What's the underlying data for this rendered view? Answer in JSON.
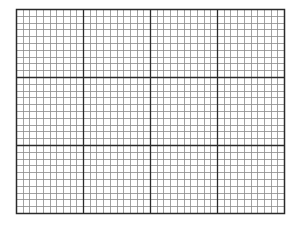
{
  "graph_paper": {
    "left": 16,
    "top": 9,
    "width": 268,
    "height": 204,
    "major_columns": 4,
    "major_rows": 3,
    "minor_per_major": 10,
    "colors": {
      "background": "#ffffff",
      "minor_line": "#8a8a8a",
      "major_line": "#2a2a2a",
      "border": "#2a2a2a"
    }
  }
}
